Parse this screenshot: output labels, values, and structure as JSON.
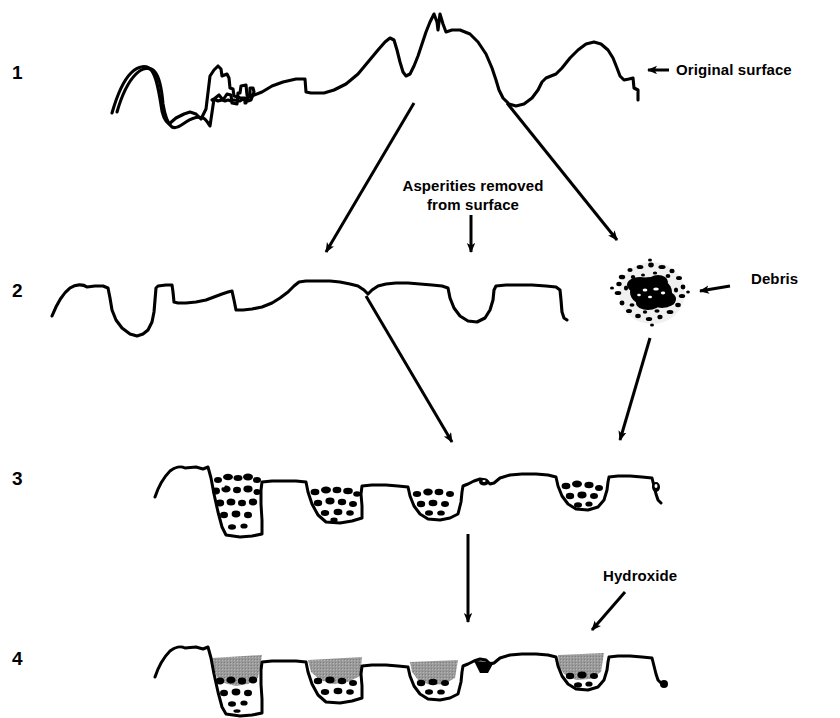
{
  "figure": {
    "background_color": "#ffffff",
    "ink_color": "#000000",
    "hydroxide_fill_color": "#999999",
    "width": 840,
    "height": 718
  },
  "stages": [
    {
      "number": "1",
      "name": "original-surface",
      "y": 72,
      "description": "Rough original surface profile with tall asperities and deep valleys"
    },
    {
      "number": "2",
      "name": "asperities-removed",
      "y": 290,
      "description": "Flattened surface after asperities are worn away, shallow pits remain"
    },
    {
      "number": "3",
      "name": "debris-filled-pits",
      "y": 478,
      "description": "Surface pits packed with loose wear debris particles"
    },
    {
      "number": "4",
      "name": "hydroxide-layer",
      "y": 658,
      "description": "Pits capped with a grey hydroxide layer over compacted debris"
    }
  ],
  "labels": {
    "original_surface": "Original surface",
    "asperities_removed_line1": "Asperities removed",
    "asperities_removed_line2": "from surface",
    "debris": "Debris",
    "hydroxide": "Hydroxide"
  },
  "annotations": [
    {
      "name": "original-surface-pointer",
      "label": "Original surface",
      "direction": "left",
      "target_stage": "1"
    },
    {
      "name": "debris-pointer",
      "label": "Debris",
      "direction": "left",
      "target_stage": "2"
    },
    {
      "name": "hydroxide-pointer",
      "label": "Hydroxide",
      "direction": "down-left",
      "target_stage": "4"
    }
  ],
  "flow_arrows": [
    {
      "name": "arrow-surface-to-stage2",
      "from_stage": "1",
      "to_stage": "2",
      "direction": "down-left"
    },
    {
      "name": "arrow-surface-to-debris",
      "from_stage": "1",
      "to_stage": "debris",
      "direction": "down-right"
    },
    {
      "name": "arrow-asperities-note",
      "from_stage": "note",
      "to_stage": "2",
      "direction": "down"
    },
    {
      "name": "arrow-stage2-to-stage3",
      "from_stage": "2",
      "to_stage": "3",
      "direction": "down-right"
    },
    {
      "name": "arrow-debris-to-stage3",
      "from_stage": "debris",
      "to_stage": "3",
      "direction": "down-left"
    },
    {
      "name": "arrow-stage3-to-stage4",
      "from_stage": "3",
      "to_stage": "4",
      "direction": "down"
    }
  ]
}
